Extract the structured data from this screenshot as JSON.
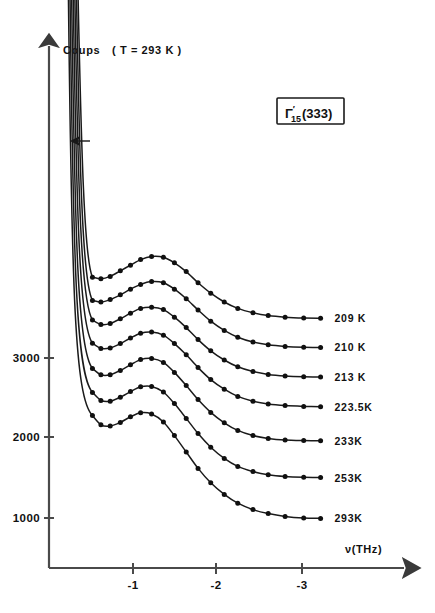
{
  "chart_data": {
    "type": "line",
    "title": "",
    "ylabel": "Coups",
    "ylabel_note": "( T = 293 K )",
    "xlabel": "ν(THz)",
    "annotation_box": {
      "base": "Γ",
      "sub": "15",
      "sup": "′",
      "suffix": "(333)"
    },
    "xlim": [
      -0.2,
      -3.6
    ],
    "ylim": [
      400,
      4600
    ],
    "xticks": [
      -1,
      -2,
      -3
    ],
    "xticklabels": [
      "-1",
      "-2",
      "-3"
    ],
    "yticks": [
      1000,
      2000,
      3000
    ],
    "yticklabels": [
      "1000",
      "2000",
      "3000"
    ],
    "grid": false,
    "legend_position": "right-inline",
    "series": [
      {
        "name": "209 K",
        "label": "209 K",
        "x": [
          -0.52,
          -0.62,
          -0.73,
          -0.85,
          -0.97,
          -1.09,
          -1.22,
          -1.36,
          -1.49,
          -1.63,
          -1.77,
          -1.92,
          -2.08,
          -2.24,
          -2.42,
          -2.6,
          -2.8,
          -3.02,
          -3.22
        ],
        "y": [
          4010,
          3990,
          4020,
          4090,
          4160,
          4230,
          4270,
          4260,
          4190,
          4080,
          3940,
          3810,
          3700,
          3620,
          3565,
          3530,
          3510,
          3500,
          3498
        ]
      },
      {
        "name": "210 K",
        "label": "210 K",
        "x": [
          -0.52,
          -0.62,
          -0.73,
          -0.85,
          -0.97,
          -1.09,
          -1.22,
          -1.36,
          -1.49,
          -1.63,
          -1.77,
          -1.92,
          -2.08,
          -2.24,
          -2.42,
          -2.6,
          -2.8,
          -3.02,
          -3.22
        ],
        "y": [
          3720,
          3700,
          3730,
          3790,
          3860,
          3920,
          3955,
          3940,
          3860,
          3740,
          3600,
          3460,
          3345,
          3260,
          3200,
          3165,
          3145,
          3135,
          3132
        ]
      },
      {
        "name": "213 K",
        "label": "213 K",
        "x": [
          -0.52,
          -0.62,
          -0.73,
          -0.85,
          -0.97,
          -1.09,
          -1.22,
          -1.36,
          -1.49,
          -1.63,
          -1.77,
          -1.92,
          -2.08,
          -2.24,
          -2.42,
          -2.6,
          -2.8,
          -3.02,
          -3.22
        ],
        "y": [
          3475,
          3420,
          3430,
          3490,
          3560,
          3620,
          3635,
          3605,
          3510,
          3380,
          3230,
          3090,
          2975,
          2890,
          2830,
          2795,
          2775,
          2765,
          2762
        ]
      },
      {
        "name": "223.5 K",
        "label": "223.5K",
        "x": [
          -0.52,
          -0.62,
          -0.73,
          -0.85,
          -0.97,
          -1.09,
          -1.22,
          -1.36,
          -1.49,
          -1.63,
          -1.77,
          -1.92,
          -2.08,
          -2.24,
          -2.42,
          -2.6,
          -2.8,
          -3.02,
          -3.22
        ],
        "y": [
          3185,
          3120,
          3125,
          3180,
          3250,
          3310,
          3325,
          3285,
          3180,
          3040,
          2880,
          2730,
          2610,
          2520,
          2460,
          2425,
          2405,
          2395,
          2390
        ]
      },
      {
        "name": "233 K",
        "label": "233K",
        "x": [
          -0.52,
          -0.62,
          -0.73,
          -0.85,
          -0.97,
          -1.09,
          -1.22,
          -1.36,
          -1.49,
          -1.63,
          -1.77,
          -1.92,
          -2.08,
          -2.24,
          -2.42,
          -2.6,
          -2.8,
          -3.02,
          -3.22
        ],
        "y": [
          2870,
          2790,
          2790,
          2845,
          2915,
          2980,
          2995,
          2945,
          2820,
          2655,
          2480,
          2320,
          2190,
          2095,
          2030,
          1995,
          1975,
          1968,
          1965
        ]
      },
      {
        "name": "253 K",
        "label": "253K",
        "x": [
          -0.52,
          -0.62,
          -0.73,
          -0.85,
          -0.97,
          -1.09,
          -1.22,
          -1.36,
          -1.49,
          -1.63,
          -1.77,
          -1.92,
          -2.08,
          -2.24,
          -2.42,
          -2.6,
          -2.8,
          -3.02,
          -3.22
        ],
        "y": [
          2570,
          2470,
          2460,
          2510,
          2580,
          2640,
          2645,
          2575,
          2430,
          2245,
          2055,
          1885,
          1745,
          1645,
          1580,
          1540,
          1518,
          1508,
          1505
        ]
      },
      {
        "name": "293 K",
        "label": "293K",
        "x": [
          -0.52,
          -0.62,
          -0.73,
          -0.85,
          -0.97,
          -1.09,
          -1.22,
          -1.36,
          -1.49,
          -1.63,
          -1.77,
          -1.92,
          -2.08,
          -2.24,
          -2.42,
          -2.6,
          -2.8,
          -3.02,
          -3.22
        ],
        "y": [
          2280,
          2165,
          2150,
          2195,
          2265,
          2315,
          2300,
          2200,
          2030,
          1825,
          1620,
          1440,
          1295,
          1185,
          1105,
          1055,
          1020,
          1000,
          995
        ]
      }
    ],
    "elastic_line_note": "steep elastic-scattering rise at left edge of each curve",
    "marker_arrow": "left-pointing arrow near elastic line"
  }
}
